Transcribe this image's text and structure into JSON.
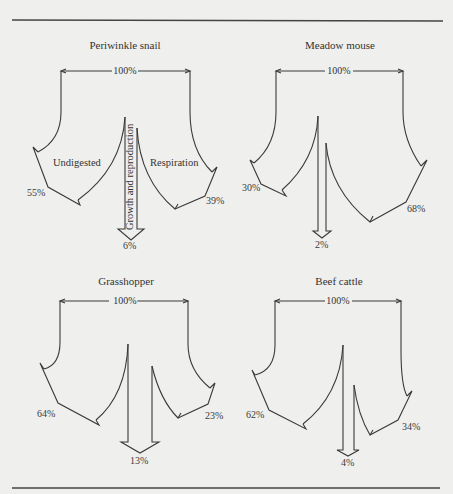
{
  "panels": [
    {
      "id": "periwinkle-snail",
      "title": "Periwinkle snail",
      "input_label": "100%",
      "left_pct": "55%",
      "right_pct": "39%",
      "center_pct": "6%",
      "left_label": "Undigested",
      "right_label": "Respiration",
      "center_label": "Growth and reproduction"
    },
    {
      "id": "meadow-mouse",
      "title": "Meadow mouse",
      "input_label": "100%",
      "left_pct": "30%",
      "right_pct": "68%",
      "center_pct": "2%"
    },
    {
      "id": "grasshopper",
      "title": "Grasshopper",
      "input_label": "100%",
      "left_pct": "64%",
      "right_pct": "23%",
      "center_pct": "13%"
    },
    {
      "id": "beef-cattle",
      "title": "Beef cattle",
      "input_label": "100%",
      "left_pct": "62%",
      "right_pct": "34%",
      "center_pct": "4%"
    }
  ],
  "legend": {
    "left_branch": "Undigested",
    "right_branch": "Respiration",
    "center_branch": "Growth and reproduction"
  },
  "colors": {
    "background": "#efefed",
    "line": "#3a3a3a"
  }
}
